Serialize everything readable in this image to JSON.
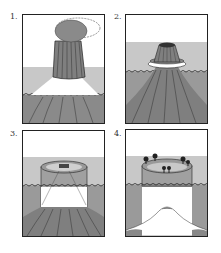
{
  "colors": {
    "sky": "#ffffff",
    "shallow_water": "#c8c8c8",
    "deep_water": "#9a9a9a",
    "volcano": "#7f7f7f",
    "volcano_dark": "#555555",
    "reef": "#a8a8a8",
    "outline": "#222222"
  },
  "panels": [
    {
      "label": "1.",
      "stage": "active-volcano-island"
    },
    {
      "label": "2.",
      "stage": "fringing-reef"
    },
    {
      "label": "3.",
      "stage": "barrier-reef"
    },
    {
      "label": "4.",
      "stage": "atoll"
    }
  ]
}
